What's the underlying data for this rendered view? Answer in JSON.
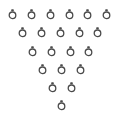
{
  "scene": {
    "background": "#ffffff",
    "ring_color": "#4a4a4a",
    "arrangement": "inverted-triangle",
    "rows": [
      {
        "count": 6,
        "y": 15,
        "x": [
          12,
          31,
          50,
          69,
          87,
          106
        ]
      },
      {
        "count": 5,
        "y": 33,
        "x": [
          22,
          41,
          60,
          79,
          97
        ]
      },
      {
        "count": 4,
        "y": 52,
        "x": [
          32,
          51,
          70,
          88
        ]
      },
      {
        "count": 3,
        "y": 70,
        "x": [
          42,
          61,
          80
        ]
      },
      {
        "count": 2,
        "y": 88,
        "x": [
          52,
          71
        ]
      },
      {
        "count": 1,
        "y": 106,
        "x": [
          61
        ]
      }
    ],
    "total_rings": 21,
    "icon": "ring-icon"
  }
}
